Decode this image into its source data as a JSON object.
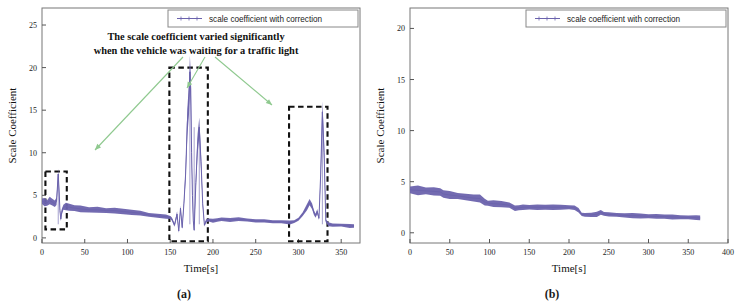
{
  "figure": {
    "panels": [
      {
        "id": "a",
        "caption": "(a)",
        "xlabel": "Time[s]",
        "ylabel": "Scale Coefficient",
        "legend_label": "scale coefficient with correction",
        "annotation_line1": "The scale coefficient  varied significantly",
        "annotation_line2": "when the vehicle was waiting for a traffic light",
        "xticks": [
          "0",
          "50",
          "100",
          "150",
          "200",
          "250",
          "300",
          "350"
        ],
        "yticks": [
          "0",
          "5",
          "10",
          "15",
          "20",
          "25"
        ]
      },
      {
        "id": "b",
        "caption": "(b)",
        "xlabel": "Time[s]",
        "ylabel": "Scale Coefficient",
        "legend_label": "scale coefficient with correction",
        "xticks": [
          "0",
          "50",
          "100",
          "150",
          "200",
          "250",
          "300",
          "350",
          "400"
        ],
        "yticks": [
          "0",
          "5",
          "10",
          "15",
          "20"
        ]
      }
    ],
    "colors": {
      "series": "#6b63ad",
      "annotation_arrow": "#8fc98f",
      "highlight_box": "#111111",
      "axis": "#555555"
    }
  },
  "chart_data": [
    {
      "type": "line",
      "panel": "a",
      "title": "",
      "xlabel": "Time[s]",
      "ylabel": "Scale Coefficient",
      "xlim": [
        0,
        372
      ],
      "ylim": [
        -0.6,
        27
      ],
      "xticks": [
        0,
        50,
        100,
        150,
        200,
        250,
        300,
        350
      ],
      "yticks": [
        0,
        5,
        10,
        15,
        20,
        25
      ],
      "grid": false,
      "legend_position": "top-right",
      "series": [
        {
          "name": "scale coefficient with correction",
          "color": "#6b63ad",
          "x": [
            0,
            3,
            6,
            9,
            12,
            15,
            17,
            19,
            20,
            21,
            22,
            23,
            25,
            28,
            32,
            38,
            45,
            55,
            65,
            75,
            85,
            95,
            105,
            115,
            125,
            135,
            145,
            150,
            152,
            155,
            158,
            160,
            162,
            164,
            166,
            168,
            170,
            172,
            173,
            174,
            175,
            176,
            177,
            178,
            180,
            182,
            184,
            186,
            188,
            190,
            192,
            195,
            200,
            205,
            210,
            220,
            230,
            240,
            250,
            260,
            270,
            280,
            290,
            295,
            300,
            305,
            310,
            313,
            316,
            318,
            320,
            322,
            324,
            326,
            328,
            330,
            332,
            335,
            340,
            350,
            360,
            365
          ],
          "y": [
            4.3,
            4.2,
            4.1,
            4.4,
            4.2,
            4.0,
            4.3,
            7.5,
            5.5,
            3.2,
            2.2,
            3.0,
            3.6,
            3.7,
            3.6,
            3.5,
            3.4,
            3.3,
            3.3,
            3.2,
            3.2,
            3.1,
            3.0,
            2.9,
            2.7,
            2.6,
            2.5,
            2.4,
            2.2,
            1.5,
            2.8,
            0.8,
            3.5,
            1.2,
            4.0,
            7.5,
            13.5,
            16.5,
            19.5,
            17.5,
            10.0,
            5.0,
            2.0,
            0.9,
            6.5,
            11.0,
            13.0,
            9.0,
            4.0,
            1.5,
            2.0,
            2.1,
            2.0,
            2.1,
            2.2,
            2.1,
            2.2,
            2.1,
            2.0,
            2.0,
            1.9,
            1.9,
            1.8,
            1.9,
            2.2,
            2.8,
            3.6,
            4.2,
            3.7,
            3.0,
            2.6,
            3.1,
            2.3,
            7.5,
            14.8,
            10.0,
            2.0,
            1.6,
            1.5,
            1.5,
            1.4,
            1.4
          ],
          "noise_band": true
        }
      ],
      "highlight_boxes": [
        {
          "x0": 4,
          "x1": 29,
          "y0": 1.0,
          "y1": 7.8,
          "style": "dashed",
          "label": "traffic-light-event-1"
        },
        {
          "x0": 149,
          "x1": 194,
          "y0": -0.4,
          "y1": 20.0,
          "style": "dashed",
          "label": "traffic-light-event-2"
        },
        {
          "x0": 289,
          "x1": 334,
          "y0": -0.4,
          "y1": 15.4,
          "style": "dashed",
          "label": "traffic-light-event-3"
        }
      ],
      "annotations": [
        {
          "text": "The scale coefficient  varied significantly\nwhen the vehicle was waiting for a traffic light",
          "points_to": [
            "traffic-light-event-1",
            "traffic-light-event-2",
            "traffic-light-event-3"
          ],
          "arrow_color": "#8fc98f"
        }
      ]
    },
    {
      "type": "line",
      "panel": "b",
      "title": "",
      "xlabel": "Time[s]",
      "ylabel": "Scale Coefficient",
      "xlim": [
        0,
        400
      ],
      "ylim": [
        -1.0,
        22
      ],
      "xticks": [
        0,
        50,
        100,
        150,
        200,
        250,
        300,
        350,
        400
      ],
      "yticks": [
        0,
        5,
        10,
        15,
        20
      ],
      "grid": false,
      "legend_position": "top-right",
      "series": [
        {
          "name": "scale coefficient with correction",
          "color": "#6b63ad",
          "x": [
            0,
            10,
            20,
            30,
            38,
            42,
            50,
            60,
            70,
            80,
            88,
            94,
            98,
            105,
            115,
            125,
            132,
            137,
            142,
            150,
            160,
            170,
            180,
            190,
            200,
            207,
            212,
            216,
            220,
            228,
            235,
            240,
            244,
            250,
            260,
            270,
            280,
            290,
            300,
            310,
            320,
            330,
            340,
            350,
            360,
            365
          ],
          "y": [
            4.2,
            4.15,
            4.1,
            4.05,
            4.0,
            3.8,
            3.7,
            3.6,
            3.5,
            3.4,
            3.35,
            3.0,
            2.9,
            2.85,
            2.8,
            2.7,
            2.4,
            2.45,
            2.5,
            2.5,
            2.5,
            2.5,
            2.5,
            2.5,
            2.5,
            2.45,
            2.2,
            1.8,
            1.75,
            1.75,
            1.8,
            2.0,
            1.85,
            1.8,
            1.75,
            1.7,
            1.68,
            1.65,
            1.62,
            1.6,
            1.58,
            1.55,
            1.52,
            1.5,
            1.48,
            1.45
          ],
          "noise_band": true
        }
      ],
      "highlight_boxes": [],
      "annotations": []
    }
  ]
}
